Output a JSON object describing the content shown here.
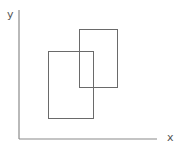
{
  "diagram": {
    "axes": {
      "x_label": "x",
      "y_label": "y",
      "color": "#8a8a8a"
    },
    "rectangles": [
      {
        "name": "rect-a",
        "x": 48,
        "y": 51,
        "width": 45,
        "height": 67
      },
      {
        "name": "rect-b",
        "x": 79,
        "y": 29,
        "width": 38,
        "height": 58
      }
    ],
    "rect_color": "#6a6a6a"
  }
}
